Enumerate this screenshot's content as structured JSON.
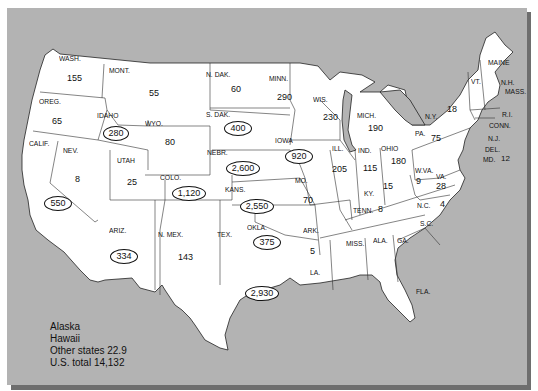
{
  "map": {
    "frame_color": "#b3b3b3",
    "shadow_color": "#6e6e6e",
    "land_color": "#ffffff",
    "states": [
      {
        "abbr": "WASH.",
        "value": "155",
        "circled": false
      },
      {
        "abbr": "OREG.",
        "value": "65",
        "circled": false
      },
      {
        "abbr": "CALIF.",
        "value": "550",
        "circled": true
      },
      {
        "abbr": "NEV.",
        "value": "8",
        "circled": false
      },
      {
        "abbr": "IDAHO",
        "value": "280",
        "circled": true
      },
      {
        "abbr": "MONT.",
        "value": "55",
        "circled": false
      },
      {
        "abbr": "WYO.",
        "value": "80",
        "circled": false
      },
      {
        "abbr": "UTAH",
        "value": "25",
        "circled": false
      },
      {
        "abbr": "COLO.",
        "value": "1,120",
        "circled": true
      },
      {
        "abbr": "ARIZ.",
        "value": "334",
        "circled": true
      },
      {
        "abbr": "N. MEX.",
        "value": "143",
        "circled": false
      },
      {
        "abbr": "N. DAK.",
        "value": "60",
        "circled": false
      },
      {
        "abbr": "S. DAK.",
        "value": "400",
        "circled": true
      },
      {
        "abbr": "NEBR.",
        "value": "2,600",
        "circled": true
      },
      {
        "abbr": "KANS.",
        "value": "2,550",
        "circled": true
      },
      {
        "abbr": "OKLA.",
        "value": "375",
        "circled": true
      },
      {
        "abbr": "TEX.",
        "value": "2,930",
        "circled": true
      },
      {
        "abbr": "MINN.",
        "value": "290",
        "circled": false
      },
      {
        "abbr": "IOWA",
        "value": "920",
        "circled": true
      },
      {
        "abbr": "MO.",
        "value": "70",
        "circled": false
      },
      {
        "abbr": "ARK.",
        "value": "5",
        "circled": false
      },
      {
        "abbr": "LA.",
        "value": "",
        "circled": false
      },
      {
        "abbr": "WIS.",
        "value": "230",
        "circled": false
      },
      {
        "abbr": "ILL.",
        "value": "205",
        "circled": false
      },
      {
        "abbr": "MICH.",
        "value": "190",
        "circled": false
      },
      {
        "abbr": "IND.",
        "value": "115",
        "circled": false
      },
      {
        "abbr": "OHIO",
        "value": "180",
        "circled": false
      },
      {
        "abbr": "KY.",
        "value": "15",
        "circled": false
      },
      {
        "abbr": "TENN.",
        "value": "8",
        "circled": false
      },
      {
        "abbr": "MISS.",
        "value": "",
        "circled": false
      },
      {
        "abbr": "ALA.",
        "value": "",
        "circled": false
      },
      {
        "abbr": "GA.",
        "value": "",
        "circled": false
      },
      {
        "abbr": "FLA.",
        "value": "",
        "circled": false
      },
      {
        "abbr": "S.C.",
        "value": "",
        "circled": false
      },
      {
        "abbr": "N.C.",
        "value": "4",
        "circled": false
      },
      {
        "abbr": "VA.",
        "value": "28",
        "circled": false
      },
      {
        "abbr": "W.VA.",
        "value": "9",
        "circled": false
      },
      {
        "abbr": "PA.",
        "value": "75",
        "circled": false
      },
      {
        "abbr": "N.Y.",
        "value": "18",
        "circled": false
      },
      {
        "abbr": "VT.",
        "value": "",
        "circled": false
      },
      {
        "abbr": "MAINE",
        "value": "",
        "circled": false
      },
      {
        "abbr": "N.H.",
        "value": "",
        "circled": false
      },
      {
        "abbr": "MASS.",
        "value": "",
        "circled": false
      },
      {
        "abbr": "R.I.",
        "value": "",
        "circled": false
      },
      {
        "abbr": "CONN.",
        "value": "",
        "circled": false
      },
      {
        "abbr": "N.J.",
        "value": "",
        "circled": false
      },
      {
        "abbr": "DEL.",
        "value": "",
        "circled": false
      },
      {
        "abbr": "MD.",
        "value": "12",
        "circled": false
      }
    ],
    "legend": {
      "line1": "Alaska",
      "line2": "Hawaii",
      "line3": "Other states 22.9",
      "line4": "U.S. total 14,132"
    }
  }
}
